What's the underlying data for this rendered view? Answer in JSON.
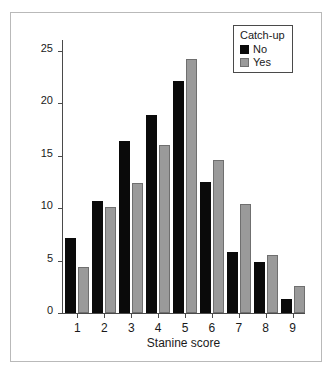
{
  "chart_data": {
    "type": "bar",
    "title": "",
    "xlabel": "Stanine score",
    "ylabel": "Percent",
    "categories": [
      "1",
      "2",
      "3",
      "4",
      "5",
      "6",
      "7",
      "8",
      "9"
    ],
    "series": [
      {
        "name": "No",
        "color": "#0a0a0a",
        "values": [
          7.1,
          10.7,
          16.4,
          18.9,
          22.1,
          12.5,
          5.8,
          4.9,
          1.3
        ]
      },
      {
        "name": "Yes",
        "color": "#9a9a9a",
        "values": [
          4.4,
          10.1,
          12.4,
          16.0,
          24.2,
          14.6,
          10.4,
          5.5,
          2.6
        ]
      }
    ],
    "ylim": [
      0,
      26
    ],
    "yticks": [
      0,
      5,
      10,
      15,
      20,
      25
    ],
    "ytick_labels": [
      "0",
      "5",
      "10",
      "15",
      "20",
      "25"
    ],
    "grid": false,
    "legend_title": "Catch-up",
    "legend_position": "top-right"
  },
  "legend": {
    "title": "Catch-up",
    "items": [
      {
        "label": "No"
      },
      {
        "label": "Yes"
      }
    ]
  },
  "axes": {
    "y_label": "Percent",
    "x_label": "Stanine score"
  },
  "colors": {
    "series_no": "#0a0a0a",
    "series_yes": "#9a9a9a",
    "axis": "#4a4a4a",
    "frame": "#b9b9b9",
    "background": "#ffffff"
  }
}
